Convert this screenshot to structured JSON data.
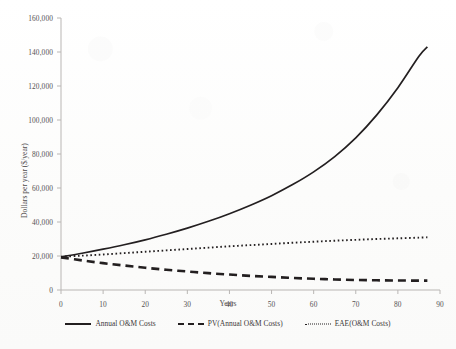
{
  "chart_data": {
    "type": "line",
    "title": "",
    "subtitle": "",
    "xlabel": "Years",
    "ylabel": "Dollars per year ($/year)",
    "xlim": [
      0,
      90
    ],
    "ylim": [
      0,
      160000
    ],
    "xticks": [
      "0",
      "10",
      "20",
      "30",
      "40",
      "50",
      "60",
      "70",
      "80",
      "90"
    ],
    "yticks": [
      "0",
      "20,000",
      "40,000",
      "60,000",
      "80,000",
      "100,000",
      "120,000",
      "140,000",
      "160,000"
    ],
    "xtick_values": [
      0,
      10,
      20,
      30,
      40,
      50,
      60,
      70,
      80,
      90
    ],
    "ytick_values": [
      0,
      20000,
      40000,
      60000,
      80000,
      100000,
      120000,
      140000,
      160000
    ],
    "grid": false,
    "legend_position": "bottom",
    "x": [
      0,
      5,
      10,
      15,
      20,
      25,
      30,
      35,
      40,
      45,
      50,
      55,
      60,
      65,
      70,
      75,
      80,
      85,
      87
    ],
    "series": [
      {
        "name": "Annual O&M Costs",
        "style": "solid",
        "color": "#231f20",
        "values": [
          19500,
          21600,
          24000,
          26600,
          29500,
          32800,
          36400,
          40400,
          44900,
          49900,
          55500,
          62000,
          69500,
          78500,
          89500,
          103000,
          119000,
          137500,
          143000
        ]
      },
      {
        "name": "PV(Annual O&M Costs)",
        "style": "dashed",
        "color": "#231f20",
        "values": [
          19200,
          17400,
          15800,
          14400,
          13100,
          11900,
          10900,
          9900,
          9100,
          8300,
          7700,
          7100,
          6600,
          6200,
          5900,
          5700,
          5600,
          5500,
          5500
        ]
      },
      {
        "name": "EAE(O&M Costs)",
        "style": "dotted",
        "color": "#231f20",
        "values": [
          19600,
          20200,
          20900,
          21700,
          22500,
          23300,
          24100,
          24900,
          25700,
          26400,
          27100,
          27800,
          28400,
          29000,
          29500,
          30000,
          30400,
          30800,
          31000
        ]
      }
    ]
  },
  "axes": {
    "y_title": "Dollars per year ($/year)",
    "x_title": "Years"
  },
  "legend": {
    "items": [
      {
        "label": "Annual O&M Costs",
        "style": "solid"
      },
      {
        "label": "PV(Annual O&M Costs)",
        "style": "dashed"
      },
      {
        "label": "EAE(O&M Costs)",
        "style": "dotted"
      }
    ]
  }
}
